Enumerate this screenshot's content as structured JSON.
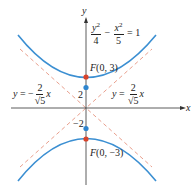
{
  "diagram": {
    "equation": {
      "term1_num": "y",
      "term1_exp": "2",
      "term1_den": "4",
      "minus": "−",
      "term2_num": "x",
      "term2_exp": "2",
      "term2_den": "5",
      "equals": "= 1"
    },
    "axes": {
      "x_label": "x",
      "y_label": "y"
    },
    "ticks": {
      "upper": "2",
      "lower": "−2"
    },
    "foci": {
      "upper": "F(0, 3)",
      "lower": "F(0, −3)"
    },
    "asymptote_left": {
      "prefix": "y = −",
      "num": "2",
      "den": "√5",
      "suffix": "x"
    },
    "asymptote_right": {
      "prefix": "y =",
      "num": "2",
      "den": "√5",
      "suffix": "x"
    },
    "colors": {
      "curve": "#3b8fd2",
      "asymptote": "#e9a08e",
      "focus": "#d8432b",
      "vertex": "#2f86cf",
      "axis": "#333333"
    }
  }
}
